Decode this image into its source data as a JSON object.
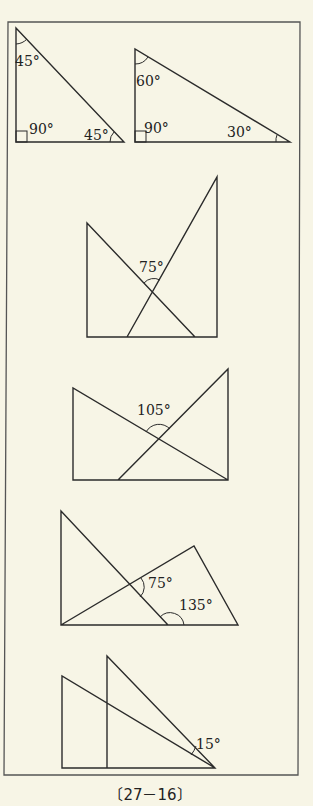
{
  "caption": "〔27－16〕",
  "figures": [
    {
      "id": "fig1a",
      "description": "Right isosceles triangle set square",
      "labels": {
        "top": "45°",
        "right_angle": "90°",
        "bottom_right": "45°"
      }
    },
    {
      "id": "fig1b",
      "description": "30-60-90 triangle set square",
      "labels": {
        "top": "60°",
        "right_angle": "90°",
        "bottom_right": "30°"
      }
    },
    {
      "id": "fig2",
      "description": "Two overlapping set squares forming an X",
      "labels": {
        "intersection": "75°"
      }
    },
    {
      "id": "fig3",
      "description": "Two overlapping set squares forming an X",
      "labels": {
        "intersection": "105°"
      }
    },
    {
      "id": "fig4",
      "description": "Overlapping triangles with marked angles",
      "labels": {
        "intersection": "75°",
        "base": "135°"
      }
    },
    {
      "id": "fig5",
      "description": "Two set squares sharing a vertex",
      "labels": {
        "vertex": "15°"
      }
    }
  ]
}
